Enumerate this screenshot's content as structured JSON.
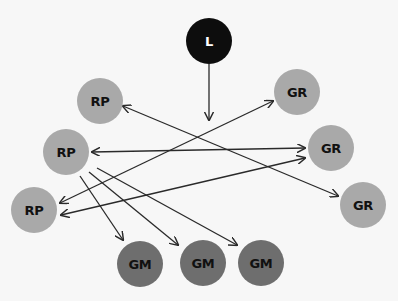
{
  "diagram": {
    "type": "network",
    "background": "#f7f7f7",
    "colors": {
      "leader_fill": "#0d0d0d",
      "leader_text": "#ffffff",
      "rp_fill": "#a9a9a9",
      "gr_fill": "#a9a9a9",
      "gm_fill": "#6e6e6e",
      "node_text": "#111111",
      "edge": "#2a2a2a"
    },
    "nodes": [
      {
        "id": "L",
        "label": "L",
        "kind": "leader",
        "cx": 209,
        "cy": 41,
        "r": 23
      },
      {
        "id": "RP1",
        "label": "RP",
        "kind": "rp",
        "cx": 100,
        "cy": 101,
        "r": 23
      },
      {
        "id": "RP2",
        "label": "RP",
        "kind": "rp",
        "cx": 66,
        "cy": 152,
        "r": 23
      },
      {
        "id": "RP3",
        "label": "RP",
        "kind": "rp",
        "cx": 34,
        "cy": 210,
        "r": 23
      },
      {
        "id": "GR1",
        "label": "GR",
        "kind": "gr",
        "cx": 297,
        "cy": 92,
        "r": 23
      },
      {
        "id": "GR2",
        "label": "GR",
        "kind": "gr",
        "cx": 331,
        "cy": 148,
        "r": 23
      },
      {
        "id": "GR3",
        "label": "GR",
        "kind": "gr",
        "cx": 363,
        "cy": 205,
        "r": 23
      },
      {
        "id": "GM1",
        "label": "GM",
        "kind": "gm",
        "cx": 140,
        "cy": 264,
        "r": 23
      },
      {
        "id": "GM2",
        "label": "GM",
        "kind": "gm",
        "cx": 203,
        "cy": 263,
        "r": 23
      },
      {
        "id": "GM3",
        "label": "GM",
        "kind": "gm",
        "cx": 261,
        "cy": 263,
        "r": 23
      }
    ],
    "edges": [
      {
        "from": "L",
        "to": "down",
        "x1": 209,
        "y1": 64,
        "x2": 209,
        "y2": 120,
        "heads": "end"
      },
      {
        "from": "RP1",
        "to": "GR3",
        "x1": 123,
        "y1": 106,
        "x2": 338,
        "y2": 196,
        "heads": "both"
      },
      {
        "from": "RP2",
        "to": "GR2",
        "x1": 92,
        "y1": 152,
        "x2": 305,
        "y2": 148,
        "heads": "both"
      },
      {
        "from": "RP3",
        "to": "GR1",
        "x1": 60,
        "y1": 203,
        "x2": 273,
        "y2": 101,
        "heads": "both"
      },
      {
        "from": "RP3",
        "to": "GR2",
        "x1": 61,
        "y1": 215,
        "x2": 305,
        "y2": 158,
        "heads": "both"
      },
      {
        "from": "RP2",
        "to": "GM1",
        "x1": 80,
        "y1": 176,
        "x2": 123,
        "y2": 240,
        "heads": "end"
      },
      {
        "from": "RP2",
        "to": "GM2",
        "x1": 89,
        "y1": 172,
        "x2": 178,
        "y2": 245,
        "heads": "end"
      },
      {
        "from": "RP2",
        "to": "GM3",
        "x1": 97,
        "y1": 168,
        "x2": 237,
        "y2": 245,
        "heads": "end"
      }
    ]
  }
}
